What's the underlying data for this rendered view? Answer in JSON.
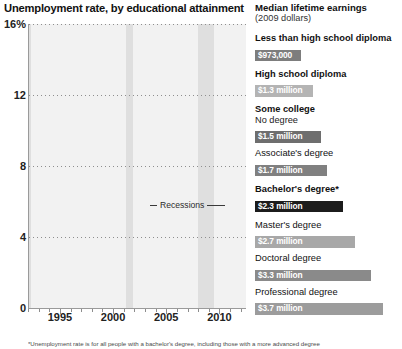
{
  "chart_title": "Unemployment rate, by educational attainment",
  "footnote": "*Unemployment rate is for all people with a bachelor's degree, including those with a more advanced degree",
  "annotation": {
    "recessions_label": "Recessions"
  },
  "side": {
    "title": "Median lifetime earnings",
    "subtitle": "(2009 dollars)",
    "entries": [
      {
        "name": "Less than high school diploma",
        "sub": "",
        "value": "$973,000",
        "color": "#7d7d7d",
        "bold": true,
        "swatch_width": 46
      },
      {
        "name": "High school diploma",
        "sub": "",
        "value": "$1.3 million",
        "color": "#b4b4b4",
        "bold": true,
        "swatch_width": 58
      },
      {
        "name": "Some college",
        "sub": "No degree",
        "value": "$1.5 million",
        "color": "#6e6e6e",
        "bold": true,
        "swatch_width": 66
      },
      {
        "name": "Associate's degree",
        "sub": "",
        "value": "$1.7 million",
        "color": "#808080",
        "bold": false,
        "swatch_width": 72
      },
      {
        "name": "Bachelor's degree*",
        "sub": "",
        "value": "$2.3 million",
        "color": "#1c1c1c",
        "bold": true,
        "swatch_width": 88
      },
      {
        "name": "Master's degree",
        "sub": "",
        "value": "$2.7 million",
        "color": "#a8a8a8",
        "bold": false,
        "swatch_width": 100
      },
      {
        "name": "Doctoral degree",
        "sub": "",
        "value": "$3.3 million",
        "color": "#8a8a8a",
        "bold": false,
        "swatch_width": 116
      },
      {
        "name": "Professional degree",
        "sub": "",
        "value": "$3.7 million",
        "color": "#9c9c9c",
        "bold": false,
        "swatch_width": 128
      }
    ]
  },
  "chart_data": {
    "type": "line",
    "title": "Unemployment rate, by educational attainment",
    "xlabel": "",
    "ylabel": "Unemployment rate (%)",
    "ylim": [
      0,
      16
    ],
    "xlim": [
      1992,
      2012.5
    ],
    "ytick_labels": [
      "0",
      "4",
      "8",
      "12",
      "16%"
    ],
    "yticks": [
      0,
      4,
      8,
      12,
      16
    ],
    "xtick_labels": [
      "1995",
      "2000",
      "2005",
      "2010"
    ],
    "xticks": [
      1995,
      2000,
      2005,
      2010
    ],
    "grid": "horizontal-dotted",
    "legend_position": "right",
    "recession_bands": [
      [
        1992.0,
        1992.25
      ],
      [
        2001.2,
        2001.9
      ],
      [
        2007.95,
        2009.5
      ]
    ],
    "series": [
      {
        "name": "Less than high school diploma",
        "color": "#8f8f8f",
        "x": [
          1992,
          1992.5,
          1993,
          1993.5,
          1994,
          1994.5,
          1995,
          1995.5,
          1996,
          1996.5,
          1997,
          1997.5,
          1998,
          1998.5,
          1999,
          1999.5,
          2000,
          2000.5,
          2001,
          2001.5,
          2002,
          2002.5,
          2003,
          2003.5,
          2004,
          2004.5,
          2005,
          2005.5,
          2006,
          2006.5,
          2007,
          2007.5,
          2008,
          2008.5,
          2009,
          2009.5,
          2010,
          2010.5,
          2011,
          2011.5,
          2012,
          2012.4
        ],
        "y": [
          11.4,
          12.2,
          11.6,
          11.3,
          10.8,
          10.4,
          10.1,
          9.8,
          9.4,
          9.1,
          8.6,
          8.3,
          7.8,
          7.5,
          7.2,
          6.9,
          6.5,
          6.4,
          7.3,
          8.0,
          8.6,
          8.9,
          8.7,
          8.4,
          8.6,
          8.2,
          7.8,
          7.6,
          7.3,
          7.0,
          7.2,
          7.6,
          8.6,
          10.5,
          13.4,
          15.4,
          15.3,
          14.9,
          14.5,
          13.9,
          13.2,
          12.5
        ]
      },
      {
        "name": "High school diploma",
        "color": "#b7b7b7",
        "x": [
          1992,
          1992.5,
          1993,
          1993.5,
          1994,
          1994.5,
          1995,
          1995.5,
          1996,
          1996.5,
          1997,
          1997.5,
          1998,
          1998.5,
          1999,
          1999.5,
          2000,
          2000.5,
          2001,
          2001.5,
          2002,
          2002.5,
          2003,
          2003.5,
          2004,
          2004.5,
          2005,
          2005.5,
          2006,
          2006.5,
          2007,
          2007.5,
          2008,
          2008.5,
          2009,
          2009.5,
          2010,
          2010.5,
          2011,
          2011.5,
          2012,
          2012.4
        ],
        "y": [
          7.6,
          8.1,
          7.6,
          7.3,
          6.8,
          6.4,
          5.9,
          5.6,
          5.3,
          5.1,
          4.8,
          4.5,
          4.2,
          4.1,
          3.9,
          3.6,
          3.5,
          3.6,
          4.2,
          4.9,
          5.4,
          5.6,
          5.5,
          5.4,
          5.2,
          5.0,
          4.8,
          4.6,
          4.3,
          4.2,
          4.4,
          4.9,
          5.7,
          7.2,
          9.6,
          10.9,
          10.6,
          10.3,
          9.8,
          9.3,
          8.6,
          8.1
        ]
      },
      {
        "name": "Some college, no degree",
        "color": "#6f6f6f",
        "x": [
          1992,
          1992.5,
          1993,
          1993.5,
          1994,
          1994.5,
          1995,
          1995.5,
          1996,
          1996.5,
          1997,
          1997.5,
          1998,
          1998.5,
          1999,
          1999.5,
          2000,
          2000.5,
          2001,
          2001.5,
          2002,
          2002.5,
          2003,
          2003.5,
          2004,
          2004.5,
          2005,
          2005.5,
          2006,
          2006.5,
          2007,
          2007.5,
          2008,
          2008.5,
          2009,
          2009.5,
          2010,
          2010.5,
          2011,
          2011.5,
          2012,
          2012.4
        ],
        "y": [
          6.6,
          7.0,
          6.6,
          6.3,
          5.8,
          5.5,
          5.0,
          4.8,
          4.5,
          4.3,
          4.0,
          3.8,
          3.5,
          3.4,
          3.3,
          3.1,
          3.0,
          3.1,
          3.6,
          4.2,
          4.8,
          5.0,
          4.9,
          4.8,
          4.6,
          4.4,
          4.2,
          4.0,
          3.8,
          3.7,
          3.8,
          4.2,
          4.9,
          6.2,
          8.0,
          9.0,
          8.8,
          8.5,
          8.2,
          7.8,
          7.4,
          7.0
        ]
      },
      {
        "name": "Associate's degree",
        "color": "#949494",
        "x": [
          1992,
          1992.5,
          1993,
          1993.5,
          1994,
          1994.5,
          1995,
          1995.5,
          1996,
          1996.5,
          1997,
          1997.5,
          1998,
          1998.5,
          1999,
          1999.5,
          2000,
          2000.5,
          2001,
          2001.5,
          2002,
          2002.5,
          2003,
          2003.5,
          2004,
          2004.5,
          2005,
          2005.5,
          2006,
          2006.5,
          2007,
          2007.5,
          2008,
          2008.5,
          2009,
          2009.5,
          2010,
          2010.5,
          2011,
          2011.5,
          2012,
          2012.4
        ],
        "y": [
          5.6,
          6.0,
          5.6,
          5.4,
          4.9,
          4.6,
          4.2,
          4.0,
          3.8,
          3.6,
          3.4,
          3.2,
          3.0,
          2.9,
          2.8,
          2.7,
          2.6,
          2.7,
          3.1,
          3.6,
          4.1,
          4.3,
          4.2,
          4.1,
          3.9,
          3.7,
          3.6,
          3.4,
          3.2,
          3.1,
          3.2,
          3.6,
          4.2,
          5.3,
          7.0,
          7.9,
          7.7,
          7.5,
          7.1,
          6.8,
          6.4,
          6.0
        ]
      },
      {
        "name": "Bachelor's degree",
        "color": "#141414",
        "x": [
          1992,
          1992.5,
          1993,
          1993.5,
          1994,
          1994.5,
          1995,
          1995.5,
          1996,
          1996.5,
          1997,
          1997.5,
          1998,
          1998.5,
          1999,
          1999.5,
          2000,
          2000.5,
          2001,
          2001.5,
          2002,
          2002.5,
          2003,
          2003.5,
          2004,
          2004.5,
          2005,
          2005.5,
          2006,
          2006.5,
          2007,
          2007.5,
          2008,
          2008.5,
          2009,
          2009.5,
          2010,
          2010.5,
          2011,
          2011.5,
          2012,
          2012.4
        ],
        "y": [
          3.5,
          3.7,
          3.5,
          3.4,
          3.1,
          2.9,
          2.7,
          2.6,
          2.5,
          2.4,
          2.2,
          2.1,
          1.9,
          1.9,
          1.8,
          1.8,
          1.7,
          1.8,
          2.1,
          2.5,
          2.9,
          3.1,
          3.1,
          3.0,
          2.8,
          2.7,
          2.5,
          2.3,
          2.1,
          2.0,
          2.0,
          2.2,
          2.6,
          3.3,
          4.5,
          5.0,
          4.8,
          4.7,
          4.4,
          4.2,
          4.0,
          3.9
        ]
      }
    ]
  }
}
